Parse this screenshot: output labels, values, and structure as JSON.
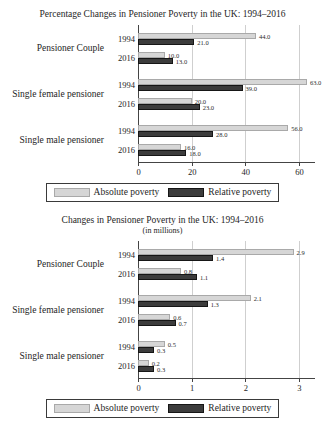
{
  "colors": {
    "absolute": "#d6d6d6",
    "absolute_border": "#a9a9a9",
    "relative": "#3c3c3c",
    "relative_border": "#161616",
    "grid": "#cfcfcf",
    "axis": "#444444",
    "text": "#1e1e1e",
    "background": "#ffffff"
  },
  "chart_data": [
    {
      "type": "bar",
      "orientation": "horizontal",
      "title": "Percentage Changes in Pensioner Poverty in the UK: 1994–2016",
      "subtitle": "",
      "xlabel": "",
      "ylabel": "",
      "xlim": [
        0,
        66
      ],
      "xticks": [
        "0",
        "20",
        "40",
        "60"
      ],
      "xtick_values": [
        0,
        20,
        40,
        60
      ],
      "grid": "vertical",
      "legend_position": "bottom",
      "series_names": [
        "Absolute poverty",
        "Relative poverty"
      ],
      "groups": [
        {
          "label": "Pensioner Couple",
          "rows": [
            {
              "year": "1994",
              "absolute": 44.0,
              "absolute_label": "44.0",
              "relative": 21.0,
              "relative_label": "21.0"
            },
            {
              "year": "2016",
              "absolute": 10.0,
              "absolute_label": "10.0",
              "relative": 13.0,
              "relative_label": "13.0"
            }
          ]
        },
        {
          "label": "Single female pensioner",
          "rows": [
            {
              "year": "1994",
              "absolute": 63.0,
              "absolute_label": "63.0",
              "relative": 39.0,
              "relative_label": "39.0"
            },
            {
              "year": "2016",
              "absolute": 20.0,
              "absolute_label": "20.0",
              "relative": 23.0,
              "relative_label": "23.0"
            }
          ]
        },
        {
          "label": "Single male pensioner",
          "rows": [
            {
              "year": "1994",
              "absolute": 56.0,
              "absolute_label": "56.0",
              "relative": 28.0,
              "relative_label": "28.0"
            },
            {
              "year": "2016",
              "absolute": 16.0,
              "absolute_label": "16.0",
              "relative": 18.0,
              "relative_label": "18.0"
            }
          ]
        }
      ],
      "legend": [
        "Absolute poverty",
        "Relative poverty"
      ]
    },
    {
      "type": "bar",
      "orientation": "horizontal",
      "title": "Changes in Pensioner Poverty in the UK: 1994–2016",
      "subtitle": "(in millions)",
      "xlabel": "",
      "ylabel": "",
      "xlim": [
        0,
        3.3
      ],
      "xticks": [
        "0",
        "1",
        "2",
        "3"
      ],
      "xtick_values": [
        0,
        1,
        2,
        3
      ],
      "grid": "vertical",
      "legend_position": "bottom",
      "series_names": [
        "Absolute poverty",
        "Relative poverty"
      ],
      "groups": [
        {
          "label": "Pensioner Couple",
          "rows": [
            {
              "year": "1994",
              "absolute": 2.9,
              "absolute_label": "2.9",
              "relative": 1.4,
              "relative_label": "1.4"
            },
            {
              "year": "2016",
              "absolute": 0.8,
              "absolute_label": "0.8",
              "relative": 1.1,
              "relative_label": "1.1"
            }
          ]
        },
        {
          "label": "Single female pensioner",
          "rows": [
            {
              "year": "1994",
              "absolute": 2.1,
              "absolute_label": "2.1",
              "relative": 1.3,
              "relative_label": "1.3"
            },
            {
              "year": "2016",
              "absolute": 0.6,
              "absolute_label": "0.6",
              "relative": 0.7,
              "relative_label": "0.7"
            }
          ]
        },
        {
          "label": "Single male pensioner",
          "rows": [
            {
              "year": "1994",
              "absolute": 0.5,
              "absolute_label": "0.5",
              "relative": 0.3,
              "relative_label": "0.3"
            },
            {
              "year": "2016",
              "absolute": 0.2,
              "absolute_label": "0.2",
              "relative": 0.3,
              "relative_label": "0.3"
            }
          ]
        }
      ],
      "legend": [
        "Absolute poverty",
        "Relative poverty"
      ]
    }
  ]
}
